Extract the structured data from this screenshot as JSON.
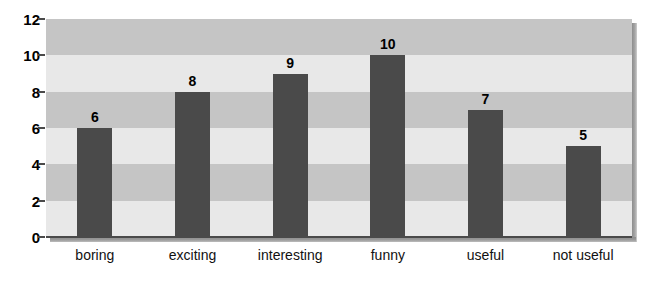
{
  "chart_data": {
    "type": "bar",
    "title": "",
    "subtitle": "",
    "xlabel": "",
    "ylabel": "",
    "categories": [
      "boring",
      "exciting",
      "interesting",
      "funny",
      "useful",
      "not useful"
    ],
    "values": [
      6,
      8,
      9,
      10,
      7,
      5
    ],
    "value_labels": [
      "6",
      "8",
      "9",
      "10",
      "7",
      "5"
    ],
    "ylim": [
      0,
      12
    ],
    "ytick_values": [
      0,
      2,
      4,
      6,
      8,
      10,
      12
    ],
    "ytick_labels": [
      "0",
      "2",
      "4",
      "6",
      "8",
      "10",
      "12"
    ],
    "grid": "horizontal-banded",
    "band_interval": 2,
    "legend": null,
    "legend_position": "none",
    "annotations": [],
    "colors": {
      "bar_fill": "#4a4a4a",
      "band_dark": "#c5c5c5",
      "band_light": "#e8e8e8",
      "axis": "#4a4a4a",
      "text": "#000000",
      "background": "#ffffff",
      "shadow": "#8d8d8d"
    }
  }
}
